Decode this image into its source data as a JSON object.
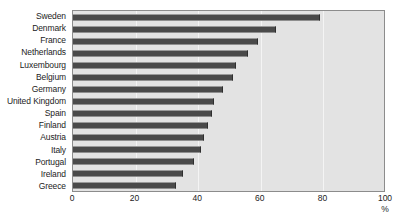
{
  "chart_data": {
    "type": "bar",
    "orientation": "horizontal",
    "title": "",
    "xlabel": "%",
    "ylabel": "",
    "xlim": [
      0,
      100
    ],
    "ylim": null,
    "grid": true,
    "legend": null,
    "xticks": [
      "0",
      "20",
      "40",
      "60",
      "80",
      "100"
    ],
    "xtick_values": [
      0,
      20,
      40,
      60,
      80,
      100
    ],
    "categories": [
      "Sweden",
      "Denmark",
      "France",
      "Netherlands",
      "Luxembourg",
      "Belgium",
      "Germany",
      "United Kingdom",
      "Spain",
      "Finland",
      "Austria",
      "Italy",
      "Portugal",
      "Ireland",
      "Greece"
    ],
    "values": [
      79,
      65,
      59,
      56,
      52,
      51,
      48,
      45,
      44.5,
      43,
      42,
      41,
      38.5,
      35,
      33
    ],
    "series": [
      {
        "name": "",
        "values": [
          79,
          65,
          59,
          56,
          52,
          51,
          48,
          45,
          44.5,
          43,
          42,
          41,
          38.5,
          35,
          33
        ]
      }
    ]
  },
  "style": {
    "bar_color": "#4a4a4a",
    "plot_background": "#e3e3e3",
    "frame_color": "#8c8c8c",
    "gridline_color": "#f4f4f4",
    "text_color": "#1c1c1c",
    "page_background": "#ffffff"
  },
  "axis": {
    "unit": "%"
  }
}
